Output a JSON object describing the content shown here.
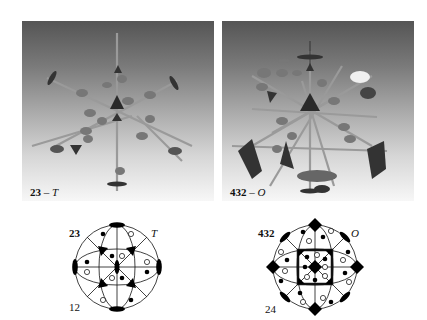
{
  "figure": {
    "left": {
      "model_caption_symbol": "23",
      "model_caption_dash": " – ",
      "model_caption_schoenflies": "T",
      "stereogram": {
        "hermann_mauguin": "23",
        "schoenflies": "T",
        "order": "12",
        "axes": [
          "2-fold (lens)",
          "3-fold (triangle)"
        ]
      }
    },
    "right": {
      "model_caption_symbol": "432",
      "model_caption_dash": " – ",
      "model_caption_schoenflies": "O",
      "stereogram": {
        "hermann_mauguin": "432",
        "schoenflies": "O",
        "order": "24",
        "axes": [
          "2-fold (lens)",
          "3-fold (triangle)",
          "4-fold (square)"
        ]
      }
    },
    "colors": {
      "ink": "#111111",
      "rod": "#9a9a9a",
      "bg_top": "#555555",
      "bg_bottom": "#f7f7f7"
    }
  }
}
